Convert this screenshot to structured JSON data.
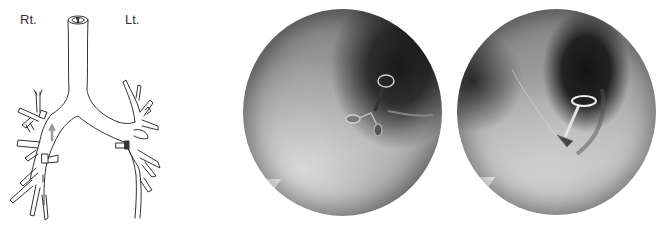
{
  "figure": {
    "diagram": {
      "description": "Line drawing of trachea and bronchial tree",
      "labels": {
        "right": "Rt.",
        "left": "Lt."
      },
      "markers": [
        "arrow-right-main-bronchus",
        "valve-right-upper",
        "valve-right-lower",
        "valve-left-upper"
      ]
    },
    "images": [
      {
        "id": "endoscopic-view-1",
        "description": "Bronchoscopic view with valve device in bronchus"
      },
      {
        "id": "endoscopic-view-2",
        "description": "Bronchoscopic view with valve device deployed at bronchus orifice"
      }
    ],
    "colors": {
      "line": "#333333",
      "arrow": "#999999",
      "background": "#ffffff"
    }
  }
}
